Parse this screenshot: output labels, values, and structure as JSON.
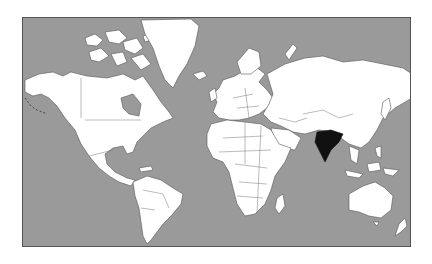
{
  "map": {
    "type": "world-political-outline",
    "projection": "mercator",
    "colors": {
      "ocean": "#9a9a9a",
      "land": "#ffffff",
      "border": "#555555",
      "highlight": "#111111"
    },
    "highlighted_country": "India",
    "regions": [
      {
        "name": "greenland"
      },
      {
        "name": "north-america"
      },
      {
        "name": "south-america"
      },
      {
        "name": "europe"
      },
      {
        "name": "africa"
      },
      {
        "name": "asia"
      },
      {
        "name": "india"
      },
      {
        "name": "australia"
      },
      {
        "name": "new-zealand"
      },
      {
        "name": "madagascar"
      },
      {
        "name": "japan"
      },
      {
        "name": "southeast-asia"
      },
      {
        "name": "arctic-islands"
      }
    ]
  }
}
